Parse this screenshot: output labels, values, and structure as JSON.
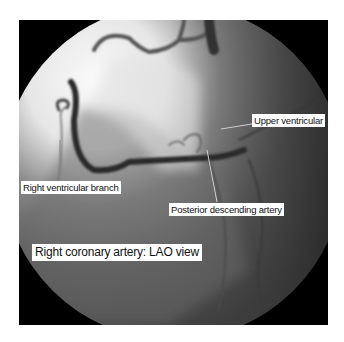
{
  "figure": {
    "title": "Right coronary artery: LAO view",
    "labels": {
      "upper_ventricular": "Upper ventricular",
      "right_ventricular_branch": "Right ventricular branch",
      "posterior_descending_artery": "Posterior descending artery",
      "caption": "Right coronary artery: LAO view"
    }
  }
}
